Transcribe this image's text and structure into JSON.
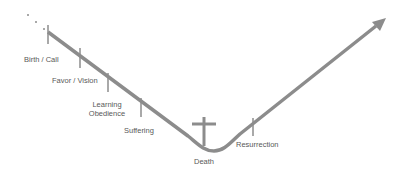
{
  "diagram": {
    "type": "journey-curve",
    "colors": {
      "line": "#8c8c8c",
      "text": "#595959",
      "background": "#ffffff"
    },
    "stages": [
      {
        "label": "Birth / Call"
      },
      {
        "label": "Favor / Vision"
      },
      {
        "label": "Learning Obedience",
        "line1": "Learning",
        "line2": "Obedience"
      },
      {
        "label": "Suffering"
      },
      {
        "label": "Death"
      },
      {
        "label": "Resurrection"
      }
    ],
    "icons": {
      "cross": "cross-icon",
      "arrow": "arrow-head-icon",
      "ellipsis": "ellipsis-dots"
    }
  }
}
